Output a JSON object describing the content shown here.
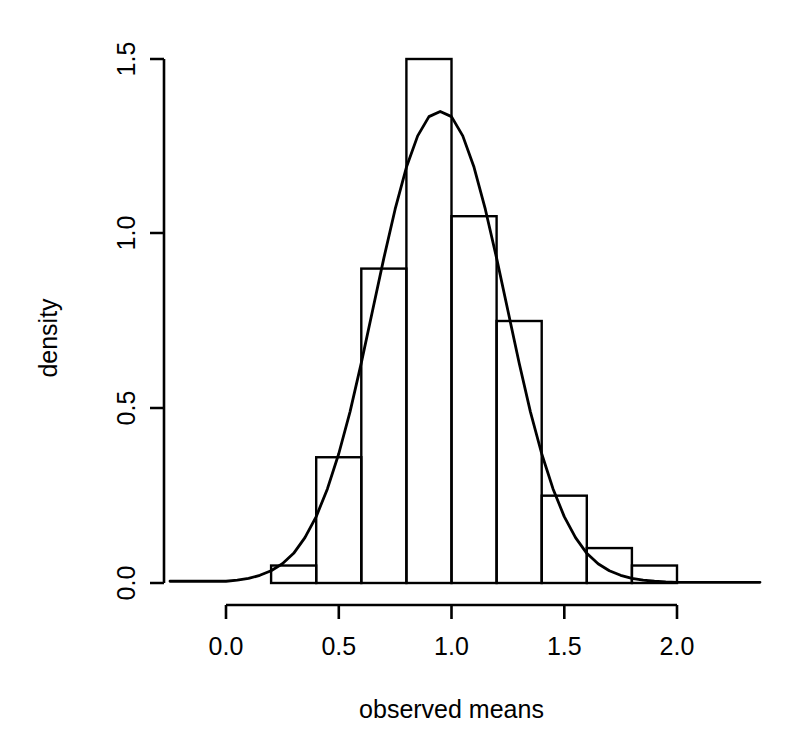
{
  "chart_data": {
    "type": "bar",
    "title": "",
    "subtitle": "",
    "xlabel": "observed means",
    "ylabel": "density",
    "xlim": [
      0.0,
      2.0
    ],
    "ylim": [
      0.0,
      1.5
    ],
    "grid": false,
    "legend": null,
    "x_ticks": [
      "0.0",
      "0.5",
      "1.0",
      "1.5",
      "2.0"
    ],
    "x_tick_values": [
      0.0,
      0.5,
      1.0,
      1.5,
      2.0
    ],
    "y_ticks": [
      "0.0",
      "0.5",
      "1.0",
      "1.5"
    ],
    "y_tick_values": [
      0.0,
      0.5,
      1.0,
      1.5
    ],
    "bin_width": 0.2,
    "bin_edges": [
      0.2,
      0.4,
      0.6,
      0.8,
      1.0,
      1.2,
      1.4,
      1.6,
      1.8,
      2.0
    ],
    "categories": [
      "0.2-0.4",
      "0.4-0.6",
      "0.6-0.8",
      "0.8-1.0",
      "1.0-1.2",
      "1.2-1.4",
      "1.4-1.6",
      "1.6-1.8",
      "1.8-2.0"
    ],
    "values": [
      0.05,
      0.36,
      0.9,
      1.5,
      1.05,
      0.75,
      0.25,
      0.1,
      0.05
    ],
    "series": [
      {
        "name": "histogram density",
        "type": "bar",
        "values": [
          0.05,
          0.36,
          0.9,
          1.5,
          1.05,
          0.75,
          0.25,
          0.1,
          0.05
        ]
      },
      {
        "name": "density curve",
        "type": "line",
        "peak_x": 0.96,
        "peak_y": 1.35,
        "x": [
          0.0,
          0.05,
          0.1,
          0.15,
          0.2,
          0.25,
          0.3,
          0.35,
          0.4,
          0.45,
          0.5,
          0.55,
          0.6,
          0.65,
          0.7,
          0.75,
          0.8,
          0.85,
          0.9,
          0.95,
          1.0,
          1.05,
          1.1,
          1.15,
          1.2,
          1.25,
          1.3,
          1.35,
          1.4,
          1.45,
          1.5,
          1.55,
          1.6,
          1.65,
          1.7,
          1.75,
          1.8,
          1.85,
          1.9,
          1.95,
          2.0
        ],
        "y": [
          0.005,
          0.008,
          0.013,
          0.022,
          0.035,
          0.055,
          0.085,
          0.13,
          0.19,
          0.27,
          0.37,
          0.49,
          0.63,
          0.78,
          0.93,
          1.07,
          1.19,
          1.28,
          1.335,
          1.35,
          1.335,
          1.28,
          1.19,
          1.07,
          0.93,
          0.78,
          0.63,
          0.49,
          0.37,
          0.27,
          0.19,
          0.13,
          0.085,
          0.055,
          0.035,
          0.022,
          0.013,
          0.008,
          0.005,
          0.003,
          0.002
        ]
      }
    ]
  }
}
